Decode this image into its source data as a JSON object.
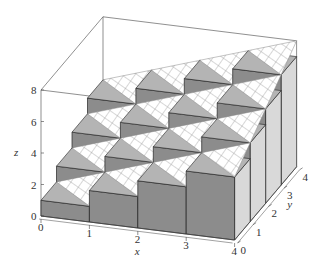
{
  "chart_data": {
    "type": "bar3d",
    "title": "",
    "xlabel": "x",
    "ylabel": "y",
    "zlabel": "z",
    "x_ticks": [
      "0",
      "1",
      "2",
      "3",
      "4"
    ],
    "y_ticks": [
      "0",
      "1",
      "2",
      "3",
      "4"
    ],
    "z_ticks": [
      "0",
      "2",
      "4",
      "6",
      "8"
    ],
    "xlim": [
      0,
      4
    ],
    "ylim": [
      0,
      4
    ],
    "zlim": [
      0,
      8
    ],
    "grid_x": [
      0,
      1,
      2,
      3
    ],
    "grid_y": [
      0,
      1,
      2,
      3
    ],
    "bar_heights": [
      [
        1,
        2,
        3,
        4
      ],
      [
        2,
        3,
        4,
        5
      ],
      [
        3,
        4,
        5,
        6
      ],
      [
        4,
        5,
        6,
        7
      ]
    ],
    "surface": {
      "equation": "z = x + y",
      "style": "hatched plane"
    },
    "colors": {
      "bar_front": "#8c8c8c",
      "bar_top": "#b4b4b4",
      "bar_side": "#d9d9d9",
      "plane": "#ffffff",
      "hatch": "#9a9a9a",
      "edge": "#222222"
    }
  }
}
